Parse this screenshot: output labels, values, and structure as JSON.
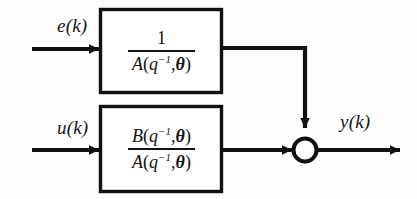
{
  "diagram": {
    "background_color": "#fefefe",
    "line_color": "#111111",
    "signals": {
      "noise_input": "e(k)",
      "control_input": "u(k)",
      "output": "y(k)"
    },
    "blocks": [
      {
        "id": "noise-block",
        "numerator": "1",
        "denominator": "A(q⁻¹,θ)",
        "numerator_italic": false
      },
      {
        "id": "plant-block",
        "numerator": "B(q⁻¹,θ)",
        "denominator": "A(q⁻¹,θ)",
        "numerator_italic": true
      }
    ],
    "summing_junction": {
      "shape": "circle",
      "label": ""
    },
    "parts": {
      "num_A": "A",
      "num_B": "B",
      "num_one": "1",
      "q_symbol": "q",
      "exponent": "−1",
      "comma": ",",
      "theta": "θ",
      "lparen": "(",
      "rparen": ")"
    }
  }
}
